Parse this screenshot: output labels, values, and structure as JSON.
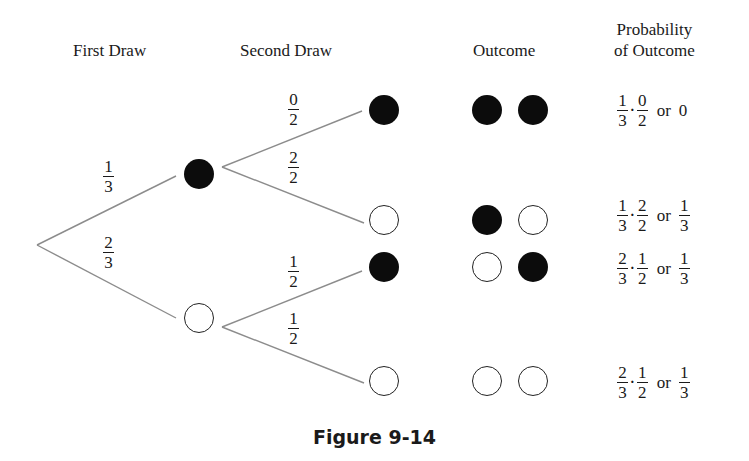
{
  "headers": {
    "first_draw": "First Draw",
    "second_draw": "Second Draw",
    "outcome": "Outcome",
    "probability_line1": "Probability",
    "probability_line2": "of Outcome"
  },
  "branches": {
    "first_black": {
      "num": "1",
      "den": "3"
    },
    "first_white": {
      "num": "2",
      "den": "3"
    },
    "bb": {
      "num": "0",
      "den": "2"
    },
    "bw": {
      "num": "2",
      "den": "2"
    },
    "wb": {
      "num": "1",
      "den": "2"
    },
    "ww": {
      "num": "1",
      "den": "2"
    }
  },
  "outcomes": [
    {
      "first": "black",
      "second": "black"
    },
    {
      "first": "black",
      "second": "white"
    },
    {
      "first": "white",
      "second": "black"
    },
    {
      "first": "white",
      "second": "white"
    }
  ],
  "probabilities": [
    {
      "a": {
        "num": "1",
        "den": "3"
      },
      "b": {
        "num": "0",
        "den": "2"
      },
      "dot": "·",
      "or": "or",
      "result": "0"
    },
    {
      "a": {
        "num": "1",
        "den": "3"
      },
      "b": {
        "num": "2",
        "den": "2"
      },
      "dot": "·",
      "or": "or",
      "result": {
        "num": "1",
        "den": "3"
      }
    },
    {
      "a": {
        "num": "2",
        "den": "3"
      },
      "b": {
        "num": "1",
        "den": "2"
      },
      "dot": "·",
      "or": "or",
      "result": {
        "num": "1",
        "den": "3"
      }
    },
    {
      "a": {
        "num": "2",
        "den": "3"
      },
      "b": {
        "num": "1",
        "den": "2"
      },
      "dot": "·",
      "or": "or",
      "result": {
        "num": "1",
        "den": "3"
      }
    }
  ],
  "caption": "Figure 9-14",
  "colors": {
    "line": "#8c8c8c",
    "black_ball": "#0c0c0c",
    "text": "#1a1a1a"
  }
}
